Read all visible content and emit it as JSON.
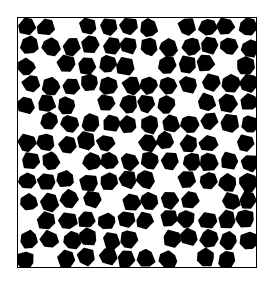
{
  "image": {
    "subject": "black and white lace net texture",
    "background_color": "#ffffff",
    "fill_color": "#000000",
    "thread_color": "#ffffff",
    "grid": {
      "cols": 12,
      "rows": 13
    },
    "patches": [
      [
        2,
        0
      ],
      [
        7,
        0
      ],
      [
        1,
        2
      ],
      [
        6,
        2
      ],
      [
        10,
        2
      ],
      [
        3,
        4
      ],
      [
        8,
        4
      ],
      [
        0,
        5
      ],
      [
        5,
        6
      ],
      [
        10,
        6
      ],
      [
        2,
        7
      ],
      [
        7,
        8
      ],
      [
        4,
        9
      ],
      [
        9,
        9
      ],
      [
        0,
        10
      ],
      [
        6,
        11
      ],
      [
        1,
        12
      ],
      [
        8,
        12
      ],
      [
        11,
        12
      ]
    ]
  }
}
